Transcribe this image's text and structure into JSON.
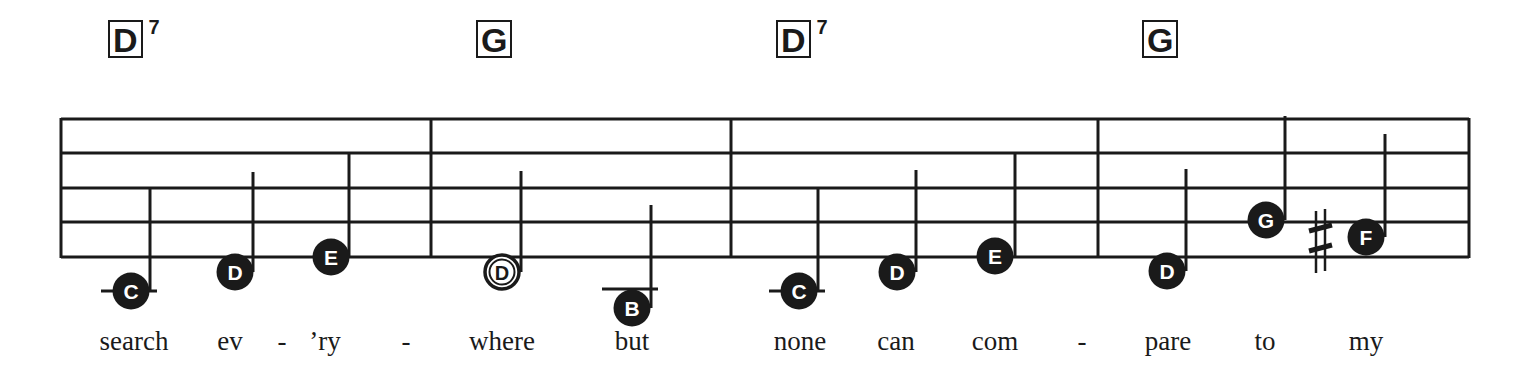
{
  "colors": {
    "ink": "#1a1a1a",
    "paper": "#ffffff"
  },
  "staff": {
    "left": 61,
    "right": 1469,
    "lines_y": [
      119,
      153,
      188,
      222,
      257
    ],
    "barlines_x": [
      61,
      431,
      731,
      1098,
      1469
    ]
  },
  "chords": [
    {
      "root": "D",
      "ext": "7",
      "x": 108
    },
    {
      "root": "G",
      "ext": "",
      "x": 476
    },
    {
      "root": "D",
      "ext": "7",
      "x": 776
    },
    {
      "root": "G",
      "ext": "",
      "x": 1142
    }
  ],
  "notes": [
    {
      "name": "C",
      "cx": 131,
      "cy": 291,
      "type": "quarter",
      "stem_x": 150,
      "stem_top": 188,
      "ledger": true
    },
    {
      "name": "D",
      "cx": 235,
      "cy": 272,
      "type": "quarter",
      "stem_x": 253,
      "stem_top": 172,
      "ledger": false
    },
    {
      "name": "E",
      "cx": 331,
      "cy": 257,
      "type": "quarter",
      "stem_x": 349,
      "stem_top": 153,
      "ledger": false
    },
    {
      "name": "D",
      "cx": 502,
      "cy": 272,
      "type": "half",
      "stem_x": 521,
      "stem_top": 171,
      "ledger": false
    },
    {
      "name": "B",
      "cx": 632,
      "cy": 308,
      "type": "quarter",
      "stem_x": 651,
      "stem_top": 205,
      "ledger": true,
      "ledger_y": 289
    },
    {
      "name": "C",
      "cx": 799,
      "cy": 291,
      "type": "quarter",
      "stem_x": 818,
      "stem_top": 188,
      "ledger": true
    },
    {
      "name": "D",
      "cx": 897,
      "cy": 272,
      "type": "quarter",
      "stem_x": 916,
      "stem_top": 170,
      "ledger": false
    },
    {
      "name": "E",
      "cx": 995,
      "cy": 256,
      "type": "quarter",
      "stem_x": 1015,
      "stem_top": 153,
      "ledger": false
    },
    {
      "name": "D",
      "cx": 1167,
      "cy": 271,
      "type": "quarter",
      "stem_x": 1186,
      "stem_top": 169,
      "ledger": false
    },
    {
      "name": "G",
      "cx": 1266,
      "cy": 220,
      "type": "quarter",
      "stem_x": 1285,
      "stem_top": 116,
      "ledger": false
    },
    {
      "name": "F",
      "cx": 1366,
      "cy": 237,
      "type": "quarter",
      "stem_x": 1385,
      "stem_top": 134,
      "ledger": false,
      "accidental": "sharp",
      "accidental_x": 1320
    }
  ],
  "lyrics": [
    {
      "text": "search",
      "x": 134
    },
    {
      "text": "ev",
      "x": 230
    },
    {
      "text": "-",
      "x": 282
    },
    {
      "text": "’ry",
      "x": 325
    },
    {
      "text": "-",
      "x": 406
    },
    {
      "text": "where",
      "x": 502
    },
    {
      "text": "but",
      "x": 632
    },
    {
      "text": "none",
      "x": 800
    },
    {
      "text": "can",
      "x": 896
    },
    {
      "text": "com",
      "x": 995
    },
    {
      "text": "-",
      "x": 1082
    },
    {
      "text": "pare",
      "x": 1168
    },
    {
      "text": "to",
      "x": 1265
    },
    {
      "text": "my",
      "x": 1366
    }
  ]
}
